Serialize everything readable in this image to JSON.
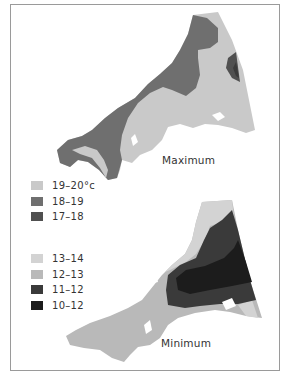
{
  "maps": [
    {
      "id": "maximum",
      "label": "Maximum",
      "legend": [
        {
          "range": "19–20°c",
          "color": "#c9c9c9"
        },
        {
          "range": "18–19",
          "color": "#6f6f6f"
        },
        {
          "range": "17–18",
          "color": "#505050"
        }
      ]
    },
    {
      "id": "minimum",
      "label": "Minimum",
      "legend": [
        {
          "range": "13–14",
          "color": "#d3d3d3"
        },
        {
          "range": "12–13",
          "color": "#b9b9b9"
        },
        {
          "range": "11–12",
          "color": "#3a3a3a"
        },
        {
          "range": "10–12",
          "color": "#1c1c1c"
        }
      ]
    }
  ],
  "colors": {
    "frame_border": "#9a9a9a",
    "background": "#ffffff"
  }
}
